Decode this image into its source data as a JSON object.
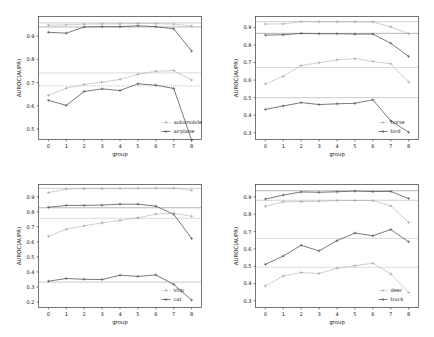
{
  "figure": {
    "width": 434,
    "height": 337,
    "background": "#ffffff",
    "rows": 2,
    "cols": 2
  },
  "style": {
    "axis_color": "#3a3a3a",
    "text_color": "#1a1a1a",
    "solid_series_color": "#4d4d4d",
    "dotted_series_color": "#9a9a9a",
    "hline_color": "#a8a8a8",
    "marker": "plus"
  },
  "chart_data": [
    {
      "type": "line",
      "panel": "top-left",
      "title": "",
      "xlabel": "group",
      "ylabel": "AUROC(AUPR)",
      "x": [
        0,
        1,
        2,
        3,
        4,
        5,
        6,
        7,
        8
      ],
      "xticklabels": [
        "0",
        "1",
        "2",
        "3",
        "4",
        "5",
        "6",
        "7",
        "8"
      ],
      "yticks": [
        0.5,
        0.6,
        0.7,
        0.8,
        0.9
      ],
      "yticklabels": [
        "0.5",
        "0.6",
        "0.7",
        "0.8",
        "0.9"
      ],
      "ylim": [
        0.455,
        0.985
      ],
      "xlim": [
        -0.55,
        8.55
      ],
      "grid": false,
      "legend_position": "lower right",
      "legend": [
        "automobile",
        "airplane"
      ],
      "series": [
        {
          "name": "automobile-auroc",
          "label": "automobile",
          "style": "dotted",
          "color": "#9a9a9a",
          "values": [
            0.948,
            0.949,
            0.952,
            0.953,
            0.953,
            0.955,
            0.954,
            0.952,
            0.944
          ]
        },
        {
          "name": "airplane-auroc",
          "label": "airplane",
          "style": "solid",
          "color": "#4d4d4d",
          "values": [
            0.917,
            0.913,
            0.94,
            0.941,
            0.941,
            0.945,
            0.941,
            0.932,
            0.836
          ]
        },
        {
          "name": "automobile-aupr",
          "label": "automobile",
          "style": "dotted",
          "color": "#9a9a9a",
          "values": [
            0.645,
            0.676,
            0.692,
            0.702,
            0.714,
            0.736,
            0.749,
            0.752,
            0.711
          ]
        },
        {
          "name": "airplane-aupr",
          "label": "airplane",
          "style": "solid",
          "color": "#4d4d4d",
          "values": [
            0.624,
            0.602,
            0.662,
            0.673,
            0.666,
            0.695,
            0.689,
            0.675,
            0.452
          ]
        }
      ],
      "hlines": [
        {
          "name": "automobile-baseline",
          "value": 0.957,
          "style": "solid",
          "color": "#a8a8a8"
        },
        {
          "name": "airplane-baseline",
          "value": 0.94,
          "style": "solid",
          "color": "#7a7a7a"
        },
        {
          "name": "automobile-aupr-baseline",
          "value": 0.742,
          "style": "solid",
          "color": "#bdbdbd"
        },
        {
          "name": "airplane-aupr-baseline",
          "value": 0.686,
          "style": "dotted",
          "color": "#8f8f8f"
        }
      ]
    },
    {
      "type": "line",
      "panel": "top-right",
      "title": "",
      "xlabel": "group",
      "ylabel": "AUROC(AUPR)",
      "x": [
        0,
        1,
        2,
        3,
        4,
        5,
        6,
        7,
        8
      ],
      "xticklabels": [
        "0",
        "1",
        "2",
        "3",
        "4",
        "5",
        "6",
        "7",
        "8"
      ],
      "yticks": [
        0.3,
        0.4,
        0.5,
        0.6,
        0.7,
        0.8,
        0.9
      ],
      "yticklabels": [
        "0.3",
        "0.4",
        "0.5",
        "0.6",
        "0.7",
        "0.8",
        "0.9"
      ],
      "ylim": [
        0.262,
        0.962
      ],
      "xlim": [
        -0.55,
        8.55
      ],
      "grid": false,
      "legend_position": "lower right",
      "legend": [
        "horse",
        "bird"
      ],
      "series": [
        {
          "name": "horse-auroc",
          "label": "horse",
          "style": "dotted",
          "color": "#9a9a9a",
          "values": [
            0.919,
            0.92,
            0.933,
            0.932,
            0.932,
            0.932,
            0.931,
            0.903,
            0.864
          ]
        },
        {
          "name": "bird-auroc",
          "label": "bird",
          "style": "solid",
          "color": "#4d4d4d",
          "values": [
            0.856,
            0.858,
            0.866,
            0.864,
            0.864,
            0.862,
            0.862,
            0.81,
            0.735
          ]
        },
        {
          "name": "horse-aupr",
          "label": "horse",
          "style": "dotted",
          "color": "#9a9a9a",
          "values": [
            0.578,
            0.622,
            0.683,
            0.699,
            0.715,
            0.722,
            0.706,
            0.693,
            0.589
          ]
        },
        {
          "name": "bird-aupr",
          "label": "bird",
          "style": "solid",
          "color": "#4d4d4d",
          "values": [
            0.433,
            0.453,
            0.472,
            0.461,
            0.465,
            0.468,
            0.488,
            0.368,
            0.303
          ]
        }
      ],
      "hlines": [
        {
          "name": "horse-baseline",
          "value": 0.933,
          "style": "solid",
          "color": "#a8a8a8"
        },
        {
          "name": "bird-baseline",
          "value": 0.866,
          "style": "solid",
          "color": "#7a7a7a"
        },
        {
          "name": "horse-aupr-baseline",
          "value": 0.672,
          "style": "solid",
          "color": "#bdbdbd"
        },
        {
          "name": "bird-aupr-baseline",
          "value": 0.5,
          "style": "solid",
          "color": "#a0a0a0"
        }
      ]
    },
    {
      "type": "line",
      "panel": "bottom-left",
      "title": "",
      "xlabel": "group",
      "ylabel": "AUROC(AUPR)",
      "x": [
        0,
        1,
        2,
        3,
        4,
        5,
        6,
        7,
        8
      ],
      "xticklabels": [
        "0",
        "1",
        "2",
        "3",
        "4",
        "5",
        "6",
        "7",
        "8"
      ],
      "yticks": [
        0.2,
        0.3,
        0.4,
        0.5,
        0.6,
        0.7,
        0.8,
        0.9
      ],
      "yticklabels": [
        "0.2",
        "0.3",
        "0.4",
        "0.5",
        "0.6",
        "0.7",
        "0.8",
        "0.9"
      ],
      "ylim": [
        0.163,
        0.982
      ],
      "xlim": [
        -0.55,
        8.55
      ],
      "grid": false,
      "legend_position": "lower right",
      "legend": [
        "ship",
        "cat"
      ],
      "series": [
        {
          "name": "ship-auroc",
          "label": "ship",
          "style": "dotted",
          "color": "#9a9a9a",
          "values": [
            0.928,
            0.952,
            0.954,
            0.954,
            0.955,
            0.956,
            0.957,
            0.957,
            0.944
          ]
        },
        {
          "name": "cat-auroc",
          "label": "cat",
          "style": "solid",
          "color": "#4d4d4d",
          "values": [
            0.83,
            0.843,
            0.843,
            0.845,
            0.851,
            0.851,
            0.838,
            0.784,
            0.622
          ]
        },
        {
          "name": "ship-aupr",
          "label": "ship",
          "style": "dotted",
          "color": "#9a9a9a",
          "values": [
            0.637,
            0.684,
            0.707,
            0.726,
            0.743,
            0.76,
            0.785,
            0.79,
            0.771
          ]
        },
        {
          "name": "cat-aupr",
          "label": "cat",
          "style": "solid",
          "color": "#4d4d4d",
          "values": [
            0.338,
            0.356,
            0.351,
            0.349,
            0.378,
            0.37,
            0.38,
            0.317,
            0.212
          ]
        }
      ],
      "hlines": [
        {
          "name": "ship-baseline",
          "value": 0.957,
          "style": "solid",
          "color": "#a8a8a8"
        },
        {
          "name": "cat-baseline",
          "value": 0.827,
          "style": "solid",
          "color": "#7a7a7a"
        },
        {
          "name": "ship-aupr-baseline",
          "value": 0.757,
          "style": "solid",
          "color": "#bdbdbd"
        },
        {
          "name": "cat-aupr-baseline",
          "value": 0.332,
          "style": "solid",
          "color": "#a0a0a0"
        }
      ]
    },
    {
      "type": "line",
      "panel": "bottom-right",
      "title": "",
      "xlabel": "group",
      "ylabel": "AUROC(AUPR)",
      "x": [
        0,
        1,
        2,
        3,
        4,
        5,
        6,
        7,
        8
      ],
      "xticklabels": [
        "0",
        "1",
        "2",
        "3",
        "4",
        "5",
        "6",
        "7",
        "8"
      ],
      "yticks": [
        0.3,
        0.4,
        0.5,
        0.6,
        0.7,
        0.8,
        0.9
      ],
      "yticklabels": [
        "0.3",
        "0.4",
        "0.5",
        "0.6",
        "0.7",
        "0.8",
        "0.9"
      ],
      "ylim": [
        0.262,
        0.972
      ],
      "xlim": [
        -0.55,
        8.55
      ],
      "grid": false,
      "legend_position": "lower right",
      "legend": [
        "deer",
        "truck"
      ],
      "series": [
        {
          "name": "truck-auroc",
          "label": "truck",
          "style": "solid",
          "color": "#4d4d4d",
          "values": [
            0.888,
            0.911,
            0.929,
            0.927,
            0.93,
            0.934,
            0.931,
            0.932,
            0.891
          ]
        },
        {
          "name": "deer-auroc",
          "label": "deer",
          "style": "dotted",
          "color": "#9a9a9a",
          "values": [
            0.846,
            0.872,
            0.873,
            0.875,
            0.88,
            0.88,
            0.879,
            0.849,
            0.753
          ]
        },
        {
          "name": "truck-aupr",
          "label": "truck",
          "style": "solid",
          "color": "#4d4d4d",
          "values": [
            0.511,
            0.559,
            0.621,
            0.589,
            0.648,
            0.692,
            0.676,
            0.712,
            0.641
          ]
        },
        {
          "name": "deer-aupr",
          "label": "deer",
          "style": "dotted",
          "color": "#9a9a9a",
          "values": [
            0.386,
            0.444,
            0.464,
            0.458,
            0.489,
            0.503,
            0.518,
            0.456,
            0.348
          ]
        }
      ],
      "hlines": [
        {
          "name": "truck-baseline",
          "value": 0.936,
          "style": "solid",
          "color": "#7a7a7a"
        },
        {
          "name": "deer-baseline",
          "value": 0.881,
          "style": "solid",
          "color": "#a8a8a8"
        },
        {
          "name": "truck-aupr-baseline",
          "value": 0.661,
          "style": "solid",
          "color": "#bdbdbd"
        },
        {
          "name": "deer-aupr-baseline",
          "value": 0.494,
          "style": "solid",
          "color": "#c0c0c0"
        }
      ]
    }
  ]
}
